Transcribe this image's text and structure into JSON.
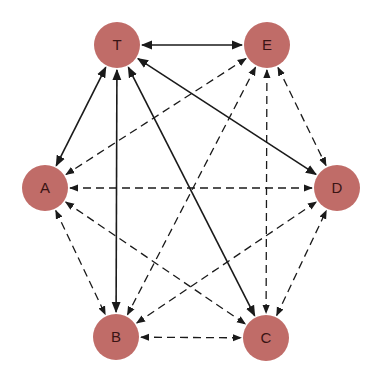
{
  "diagram": {
    "node_color": "#c06c68",
    "label_color": "#3a1414",
    "edge_color": "#1a1a1a",
    "node_radius": 23,
    "nodes": [
      {
        "id": "T",
        "label": "T",
        "x": 117,
        "y": 45
      },
      {
        "id": "E",
        "label": "E",
        "x": 267,
        "y": 45
      },
      {
        "id": "A",
        "label": "A",
        "x": 45,
        "y": 188
      },
      {
        "id": "D",
        "label": "D",
        "x": 337,
        "y": 188
      },
      {
        "id": "B",
        "label": "B",
        "x": 116,
        "y": 337
      },
      {
        "id": "C",
        "label": "C",
        "x": 266,
        "y": 338
      }
    ],
    "edges": [
      {
        "from": "T",
        "to": "E",
        "style": "solid"
      },
      {
        "from": "T",
        "to": "A",
        "style": "solid"
      },
      {
        "from": "T",
        "to": "B",
        "style": "solid"
      },
      {
        "from": "T",
        "to": "C",
        "style": "solid"
      },
      {
        "from": "T",
        "to": "D",
        "style": "solid"
      },
      {
        "from": "E",
        "to": "A",
        "style": "dashed"
      },
      {
        "from": "E",
        "to": "B",
        "style": "dashed"
      },
      {
        "from": "E",
        "to": "C",
        "style": "dashed"
      },
      {
        "from": "E",
        "to": "D",
        "style": "dashed"
      },
      {
        "from": "A",
        "to": "D",
        "style": "dashed"
      },
      {
        "from": "A",
        "to": "B",
        "style": "dashed"
      },
      {
        "from": "A",
        "to": "C",
        "style": "dashed"
      },
      {
        "from": "B",
        "to": "D",
        "style": "dashed"
      },
      {
        "from": "B",
        "to": "C",
        "style": "dashed"
      },
      {
        "from": "C",
        "to": "D",
        "style": "dashed"
      }
    ]
  }
}
